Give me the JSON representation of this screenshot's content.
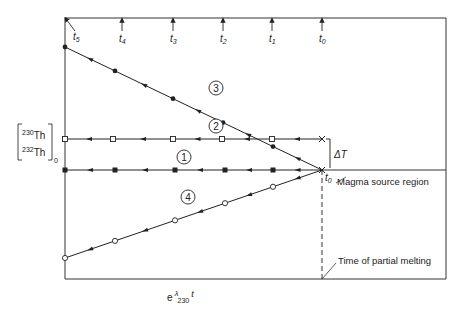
{
  "diagram": {
    "type": "isotope-evolution-diagram",
    "y_axis_label": {
      "numerator": "Th",
      "numerator_mass": "230",
      "denominator": "Th",
      "denominator_mass": "232",
      "subscript": "0"
    },
    "x_axis_label": {
      "base": "e",
      "exponent": "λ",
      "exponent_subscript": "230",
      "suffix": "t"
    },
    "time_markers": [
      {
        "label": "t",
        "sub": "5"
      },
      {
        "label": "t",
        "sub": "4"
      },
      {
        "label": "t",
        "sub": "3"
      },
      {
        "label": "t",
        "sub": "2"
      },
      {
        "label": "t",
        "sub": "1"
      },
      {
        "label": "t",
        "sub": "0"
      }
    ],
    "origin_label": {
      "label": "t",
      "sub": "0"
    },
    "delta_label": "ΔT",
    "annotations": {
      "magma_source": "Magma source region",
      "partial_melting": "Time of partial melting"
    },
    "series": [
      {
        "id": "1",
        "label": "1",
        "marker": "filled-square",
        "trend": "horizontal"
      },
      {
        "id": "2",
        "label": "2",
        "marker": "open-square",
        "trend": "horizontal-offset"
      },
      {
        "id": "3",
        "label": "3",
        "marker": "filled-dot",
        "trend": "increasing"
      },
      {
        "id": "4",
        "label": "4",
        "marker": "open-circle",
        "trend": "decreasing"
      }
    ]
  }
}
